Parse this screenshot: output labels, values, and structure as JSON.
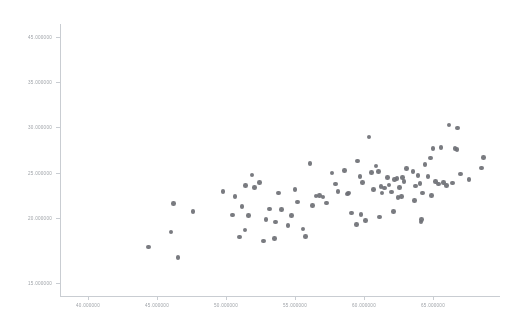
{
  "chart_data": {
    "type": "scatter",
    "title": "",
    "subtitle": "",
    "xlabel": "",
    "ylabel": "",
    "grid": false,
    "legend": false,
    "legend_position": "none",
    "marker_color": "#6e7076",
    "axis_color": "#c9cdd2",
    "tick_label_color": "#8d9298",
    "xlim": [
      40.0,
      65.0
    ],
    "ylim": [
      15.0,
      45.0
    ],
    "xticks": [
      40.0,
      45.0,
      50.0,
      55.0,
      60.0,
      65.0
    ],
    "yticks": [
      45.0,
      35.0,
      30.0,
      25.0,
      20.0,
      15.0
    ],
    "xtick_labels": [
      "40.000000",
      "45.000000",
      "50.000000",
      "55.000000",
      "60.000000",
      "65.000000"
    ],
    "ytick_labels": [
      "45.000000",
      "35.000000",
      "30.000000",
      "25.000000",
      "20.000000",
      "15.000000"
    ],
    "ytick_positions_px": [
      37,
      82,
      127,
      173,
      218,
      283
    ],
    "xtick_positions_px": [
      88,
      157,
      226,
      295,
      364,
      433
    ],
    "series": [
      {
        "name": "series-1",
        "color": "#6e7076",
        "marker": "circle",
        "points": [
          [
            45.02,
            20.4
          ],
          [
            46.45,
            25.2
          ],
          [
            46.3,
            22.05
          ],
          [
            46.7,
            19.25
          ],
          [
            47.55,
            24.35
          ],
          [
            49.25,
            26.55
          ],
          [
            49.95,
            25.95
          ],
          [
            49.8,
            23.95
          ],
          [
            50.55,
            27.2
          ],
          [
            50.35,
            24.85
          ],
          [
            50.9,
            28.35
          ],
          [
            50.7,
            23.9
          ],
          [
            51.05,
            26.95
          ],
          [
            50.5,
            22.3
          ],
          [
            50.2,
            21.5
          ],
          [
            51.7,
            23.45
          ],
          [
            51.9,
            24.6
          ],
          [
            52.25,
            23.15
          ],
          [
            52.4,
            26.35
          ],
          [
            52.6,
            24.55
          ],
          [
            52.2,
            21.35
          ],
          [
            53.15,
            23.9
          ],
          [
            53.35,
            26.75
          ],
          [
            53.5,
            25.35
          ],
          [
            54.2,
            29.6
          ],
          [
            54.55,
            26.05
          ],
          [
            54.75,
            26.1
          ],
          [
            54.95,
            25.9
          ],
          [
            55.65,
            27.35
          ],
          [
            55.8,
            26.55
          ],
          [
            56.15,
            28.85
          ],
          [
            56.35,
            26.25
          ],
          [
            56.4,
            26.35
          ],
          [
            56.55,
            24.15
          ],
          [
            56.9,
            29.9
          ],
          [
            57.05,
            28.2
          ],
          [
            57.2,
            27.55
          ],
          [
            57.1,
            24.0
          ],
          [
            57.35,
            23.35
          ],
          [
            56.85,
            22.9
          ],
          [
            57.55,
            32.55
          ],
          [
            57.7,
            28.6
          ],
          [
            57.95,
            29.35
          ],
          [
            58.1,
            28.75
          ],
          [
            58.25,
            27.1
          ],
          [
            58.3,
            26.35
          ],
          [
            58.45,
            26.9
          ],
          [
            58.6,
            28.05
          ],
          [
            58.15,
            23.7
          ],
          [
            58.7,
            27.25
          ],
          [
            58.85,
            26.45
          ],
          [
            59.0,
            27.85
          ],
          [
            59.15,
            27.95
          ],
          [
            59.3,
            26.95
          ],
          [
            59.2,
            25.85
          ],
          [
            59.45,
            28.1
          ],
          [
            59.55,
            27.6
          ],
          [
            59.4,
            25.95
          ],
          [
            60.05,
            28.7
          ],
          [
            60.2,
            27.15
          ],
          [
            60.35,
            28.3
          ],
          [
            60.45,
            27.4
          ],
          [
            60.6,
            26.35
          ],
          [
            60.55,
            23.45
          ],
          [
            60.5,
            23.15
          ],
          [
            60.75,
            29.5
          ],
          [
            60.9,
            28.15
          ],
          [
            61.05,
            30.2
          ],
          [
            61.2,
            31.3
          ],
          [
            61.35,
            27.6
          ],
          [
            61.5,
            27.35
          ],
          [
            61.65,
            31.4
          ],
          [
            61.8,
            27.5
          ],
          [
            61.95,
            27.2
          ],
          [
            62.1,
            33.85
          ],
          [
            62.45,
            31.25
          ],
          [
            62.55,
            31.15
          ],
          [
            62.6,
            33.55
          ],
          [
            62.3,
            27.45
          ],
          [
            63.25,
            27.85
          ],
          [
            63.95,
            29.1
          ],
          [
            64.05,
            30.25
          ],
          [
            52.95,
            22.75
          ],
          [
            53.8,
            22.4
          ],
          [
            51.35,
            27.55
          ],
          [
            54.35,
            24.95
          ],
          [
            55.15,
            25.25
          ],
          [
            55.45,
            28.55
          ],
          [
            57.8,
            26.75
          ],
          [
            58.95,
            24.3
          ],
          [
            59.7,
            29.05
          ],
          [
            60.15,
            25.55
          ],
          [
            61.1,
            26.1
          ],
          [
            62.75,
            28.45
          ],
          [
            53.95,
            21.55
          ],
          [
            51.55,
            21.05
          ]
        ]
      }
    ]
  }
}
